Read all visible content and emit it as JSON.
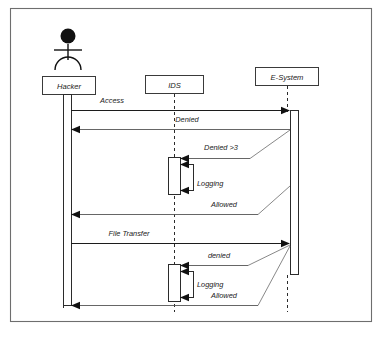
{
  "diagram": {
    "type": "uml-sequence-diagram",
    "title": "",
    "actor": {
      "name": "actor-stick-figure",
      "label": ""
    },
    "lifelines": [
      {
        "id": "hacker",
        "label": "Hacker",
        "kind": "actor-lifeline",
        "x": 68,
        "box": {
          "x": 42,
          "y": 76,
          "w": 53,
          "h": 18
        }
      },
      {
        "id": "ids",
        "label": "IDS",
        "kind": "object-lifeline",
        "x": 174,
        "box": {
          "x": 145,
          "y": 75,
          "w": 58,
          "h": 18
        }
      },
      {
        "id": "esystem",
        "label": "E-System",
        "kind": "object-lifeline",
        "x": 287,
        "box": {
          "x": 255,
          "y": 67,
          "w": 63,
          "h": 18
        }
      }
    ],
    "messages": [
      {
        "id": "m1",
        "label": "Access",
        "from": "hacker",
        "to": "esystem",
        "direction": "right",
        "style": "solid",
        "y": 110,
        "label_x": 112,
        "label_y": 103
      },
      {
        "id": "m2",
        "label": "Denied",
        "from": "esystem",
        "to": "hacker",
        "direction": "left",
        "style": "solid",
        "y": 129,
        "label_x": 187,
        "label_y": 122
      },
      {
        "id": "m3",
        "label": "Denied >3",
        "from": "esystem",
        "to": "ids",
        "direction": "left",
        "style": "solid",
        "y": 158,
        "label_x": 220,
        "label_y": 150
      },
      {
        "id": "m4",
        "label": "Logging",
        "from": "ids",
        "to": "ids",
        "direction": "self",
        "style": "solid",
        "y": 183,
        "label_x": 196,
        "label_y": 186
      },
      {
        "id": "m5",
        "label": "Allowed",
        "from": "esystem",
        "to": "hacker",
        "direction": "left",
        "style": "solid",
        "y": 214,
        "label_x": 224,
        "label_y": 207
      },
      {
        "id": "m6",
        "label": "File Transfer",
        "from": "hacker",
        "to": "esystem",
        "direction": "right",
        "style": "solid",
        "y": 243,
        "label_x": 128,
        "label_y": 236
      },
      {
        "id": "m7",
        "label": "denied",
        "from": "esystem",
        "to": "ids",
        "direction": "left",
        "style": "solid",
        "y": 265,
        "label_x": 218,
        "label_y": 258
      },
      {
        "id": "m8",
        "label": "Logging",
        "from": "ids",
        "to": "ids",
        "direction": "self",
        "style": "solid",
        "y": 290,
        "label_x": 196,
        "label_y": 287
      },
      {
        "id": "m9",
        "label": "Allowed",
        "from": "esystem",
        "to": "hacker",
        "direction": "left",
        "style": "solid",
        "y": 305,
        "label_x": 224,
        "label_y": 298
      }
    ],
    "activations": [
      {
        "id": "a-hacker",
        "lifeline": "hacker",
        "x": 63,
        "y": 94,
        "w": 8,
        "h": 212
      },
      {
        "id": "a-ids-1",
        "lifeline": "ids",
        "x": 168,
        "y": 157,
        "w": 12,
        "h": 37
      },
      {
        "id": "a-ids-1-nested",
        "lifeline": "ids",
        "x": 180,
        "y": 164,
        "w": 13,
        "h": 26
      },
      {
        "id": "a-ids-2",
        "lifeline": "ids",
        "x": 168,
        "y": 264,
        "w": 12,
        "h": 37
      },
      {
        "id": "a-ids-2-nested",
        "lifeline": "ids",
        "x": 180,
        "y": 271,
        "w": 13,
        "h": 26
      },
      {
        "id": "a-esystem",
        "lifeline": "esystem",
        "x": 290,
        "y": 110,
        "w": 9,
        "h": 165
      }
    ],
    "frame": {
      "x": 10,
      "y": 8,
      "w": 362,
      "h": 314
    },
    "colors": {
      "background": "#ffffff",
      "frame_border": "#6e6e6e",
      "box_border": "#3a3a3a",
      "line": "#555555",
      "line_dark": "#1c1c1c",
      "text": "#1a1a1a"
    }
  }
}
